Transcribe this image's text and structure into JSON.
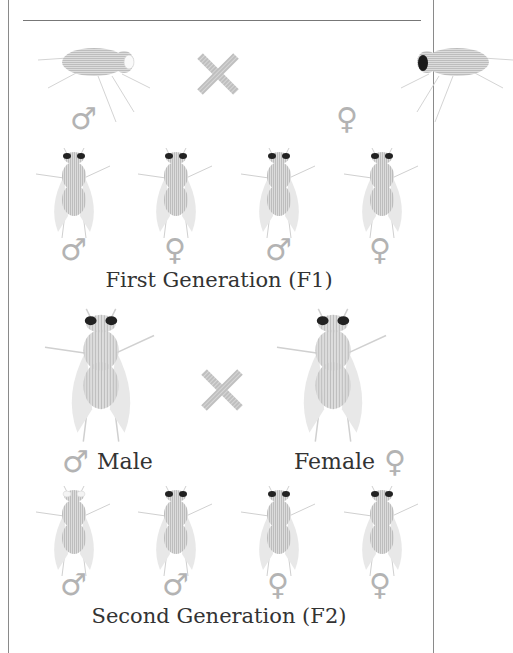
{
  "diagram": {
    "colors": {
      "fly_body": "#c8c8c8",
      "eye_red": "#222222",
      "eye_white": "#ffffff",
      "cross": "#c4c4c4",
      "symbol": "#b3b3b3",
      "text": "#333333",
      "border": "#8a8a8a"
    },
    "parents": {
      "male": {
        "symbol": "♂",
        "eye": "white",
        "view": "side"
      },
      "female": {
        "symbol": "♀",
        "eye": "red",
        "view": "side"
      },
      "cross_symbol": "×"
    },
    "f1": {
      "caption": "First Generation (F1)",
      "flies": [
        {
          "symbol": "♂",
          "eye": "red"
        },
        {
          "symbol": "♀",
          "eye": "red"
        },
        {
          "symbol": "♂",
          "eye": "red"
        },
        {
          "symbol": "♀",
          "eye": "red"
        }
      ]
    },
    "f1_cross": {
      "male_symbol": "♂",
      "male_label": "Male",
      "female_label": "Female",
      "female_symbol": "♀",
      "cross_symbol": "×"
    },
    "f2": {
      "caption": "Second Generation (F2)",
      "flies": [
        {
          "symbol": "♂",
          "eye": "white"
        },
        {
          "symbol": "♂",
          "eye": "red"
        },
        {
          "symbol": "♀",
          "eye": "red"
        },
        {
          "symbol": "♀",
          "eye": "red"
        }
      ]
    }
  }
}
